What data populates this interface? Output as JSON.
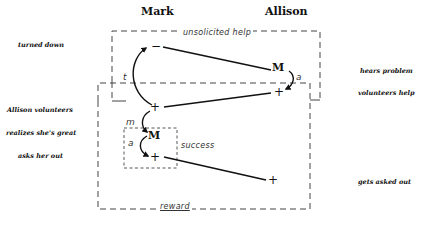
{
  "diagram": {
    "columns": {
      "left": "Mark",
      "right": "Allison"
    },
    "left_labels": [
      "turned down",
      "Allison volunteers",
      "realizes she's great",
      "asks her out"
    ],
    "right_labels": [
      "hears problem",
      "volunteers help",
      "gets asked out"
    ],
    "regions": {
      "outer_top": "unsolicited help",
      "inner_small": "success",
      "outer_bottom": "reward"
    },
    "nodes": {
      "mark_minus": "−",
      "allison_M": "M",
      "allison_plus": "+",
      "mark_plus_top": "+",
      "mark_M": "M",
      "mark_plus_bottom": "+",
      "allison_plus_bottom": "+"
    },
    "arrow_labels": {
      "t": "t",
      "allison_a": "a",
      "m": "m",
      "mark_a": "a"
    }
  }
}
